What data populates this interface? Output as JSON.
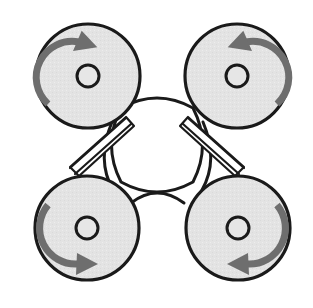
{
  "figure": {
    "background_color": "#ffffff",
    "width": 313,
    "height": 308
  },
  "style": {
    "disc_fill": "#e3e3e3",
    "disc_stroke": "#1a1a1a",
    "disc_stroke_width": 3.2,
    "hub_fill": "#e6e6e6",
    "hub_stroke": "#1a1a1a",
    "hub_stroke_width": 3.0,
    "arrow_color": "#6e6e6e",
    "arrow_stroke_width": 7,
    "body_fill": "#ffffff",
    "body_stroke": "#1a1a1a",
    "body_stroke_width": 3.0,
    "strut_fill": "#ffffff",
    "strut_stroke": "#1a1a1a",
    "strut_stroke_width": 2.2,
    "arm_stroke": "#1a1a1a",
    "arm_stroke_width": 3.0
  },
  "body": {
    "name": "central-frame",
    "center_x": 157,
    "center_y": 155,
    "fill": "#ffffff",
    "outline_path": "M 121 108 Q 157 88 193 108 Q 212 145 193 182 Q 157 202 121 182 Q 102 145 121 108 Z"
  },
  "rotors": [
    {
      "id": "rotor-front-left",
      "position": "top-left",
      "cx": 88,
      "cy": 76,
      "radius": 52,
      "hub_radius": 11,
      "spin": "clockwise",
      "spin_label": "CW",
      "arrow": {
        "name": "rotation-arrow-clockwise",
        "path": "M 48 104 A 36 36 0 0 1 79 42",
        "head_points": "78,32 98,43 76,54",
        "head_angle": 18
      }
    },
    {
      "id": "rotor-front-right",
      "position": "top-right",
      "cx": 237,
      "cy": 76,
      "radius": 52,
      "hub_radius": 11,
      "spin": "counter-clockwise",
      "spin_label": "CCW",
      "arrow": {
        "name": "rotation-arrow-counter-clockwise",
        "path": "M 277 104 A 36 36 0 0 0 246 42",
        "head_points": "247,32 227,43 249,54",
        "head_angle": -18
      }
    },
    {
      "id": "rotor-rear-left",
      "position": "bottom-left",
      "cx": 87,
      "cy": 228,
      "radius": 52,
      "hub_radius": 11,
      "spin": "counter-clockwise",
      "spin_label": "CCW",
      "arrow": {
        "name": "rotation-arrow-counter-clockwise",
        "path": "M 48 205 A 36 36 0 0 0 78 264",
        "head_points": "77,253 98,264 76,275",
        "head_angle": 0
      }
    },
    {
      "id": "rotor-rear-right",
      "position": "bottom-right",
      "cx": 238,
      "cy": 228,
      "radius": 52,
      "hub_radius": 11,
      "spin": "clockwise",
      "spin_label": "CW",
      "arrow": {
        "name": "rotation-arrow-clockwise",
        "path": "M 277 205 A 36 36 0 0 1 247 264",
        "head_points": "248,253 227,264 249,275",
        "head_angle": 0
      }
    }
  ],
  "struts": [
    {
      "id": "strut-front-left",
      "name": "frame-strut-front-left",
      "type": "double-line",
      "outer_path": "M 126 118 L 70 168",
      "inner_path": "M 131 124 L 75 174",
      "quad": "126,117 134,126 79,176 70,167"
    },
    {
      "id": "strut-front-right",
      "name": "frame-strut-front-right",
      "type": "double-line",
      "outer_path": "M 188 118 L 244 168",
      "inner_path": "M 183 124 L 239 174",
      "quad": "188,117 180,126 235,176 244,167"
    }
  ],
  "arms": [
    {
      "id": "arm-left-vertical",
      "name": "frame-arm-left",
      "type": "single-curve",
      "path": "M 112 122 Q 96 160 113 190"
    },
    {
      "id": "arm-right-vertical",
      "name": "frame-arm-right",
      "type": "single-curve",
      "path": "M 203 122 Q 219 160 202 190"
    },
    {
      "id": "arm-bottom-bridge",
      "name": "frame-arm-bottom-bridge",
      "type": "single-curve",
      "path": "M 131 203 Q 157 183 184 203"
    }
  ]
}
